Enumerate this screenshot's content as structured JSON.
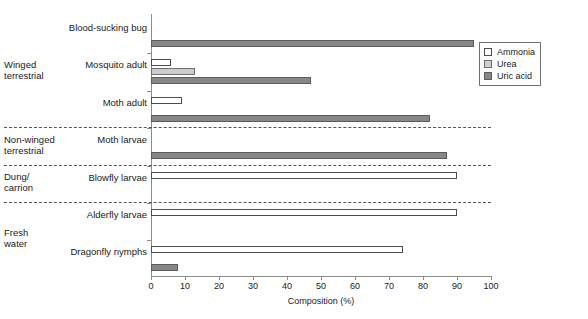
{
  "chart_data": {
    "type": "bar",
    "orientation": "horizontal",
    "title": "",
    "xlabel": "Composition (%)",
    "ylabel": "",
    "xlim": [
      0,
      100
    ],
    "xticks": [
      0,
      10,
      20,
      30,
      40,
      50,
      60,
      70,
      80,
      90,
      100
    ],
    "grid": false,
    "legend_position": "top-right",
    "series": [
      {
        "name": "Ammonia",
        "color": "#ffffff",
        "values": [
          0,
          6,
          9,
          0,
          90,
          90,
          74
        ]
      },
      {
        "name": "Urea",
        "color": "#cdcdcd",
        "values": [
          0,
          13,
          0,
          0,
          0,
          0,
          0
        ]
      },
      {
        "name": "Uric acid",
        "color": "#878787",
        "values": [
          95,
          47,
          82,
          87,
          0,
          0,
          8
        ]
      }
    ],
    "categories": [
      "Blood-sucking bug",
      "Mosquito adult",
      "Moth adult",
      "Moth larvae",
      "Blowfly larvae",
      "Alderfly larvae",
      "Dragonfly nymphs"
    ],
    "groups": [
      {
        "label": "Winged terrestrial",
        "lines": [
          "Winged",
          "terrestrial"
        ],
        "categories": [
          "Blood-sucking bug",
          "Mosquito adult",
          "Moth adult"
        ]
      },
      {
        "label": "Non-winged terrestrial",
        "lines": [
          "Non-winged",
          "terrestrial"
        ],
        "categories": [
          "Moth larvae"
        ]
      },
      {
        "label": "Dung/ carrion",
        "lines": [
          "Dung/",
          "carrion"
        ],
        "categories": [
          "Blowfly larvae"
        ]
      },
      {
        "label": "Fresh water",
        "lines": [
          "Fresh",
          "water"
        ],
        "categories": [
          "Alderfly larvae",
          "Dragonfly nymphs"
        ]
      }
    ]
  },
  "legend": {
    "items": [
      {
        "label": "Ammonia",
        "swatch": "ammonia"
      },
      {
        "label": "Urea",
        "swatch": "urea"
      },
      {
        "label": "Uric acid",
        "swatch": "uric"
      }
    ]
  }
}
